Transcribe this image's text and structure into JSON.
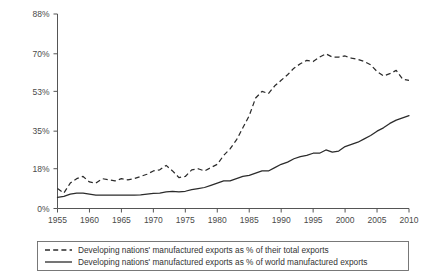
{
  "chart_data": {
    "type": "line",
    "title": "",
    "xlabel": "",
    "ylabel": "",
    "xlim": [
      1955,
      2010
    ],
    "ylim": [
      0,
      88
    ],
    "grid": false,
    "legend_position": "bottom",
    "ytick_labels": [
      "0%",
      "18%",
      "35%",
      "53%",
      "70%",
      "88%"
    ],
    "ytick_values": [
      0,
      18,
      35,
      53,
      70,
      88
    ],
    "xtick_labels": [
      "1955",
      "1960",
      "1965",
      "1970",
      "1975",
      "1980",
      "1985",
      "1990",
      "1995",
      "2000",
      "2005",
      "2010"
    ],
    "xtick_values": [
      1955,
      1960,
      1965,
      1970,
      1975,
      1980,
      1985,
      1990,
      1995,
      2000,
      2005,
      2010
    ],
    "x": [
      1955,
      1956,
      1957,
      1958,
      1959,
      1960,
      1961,
      1962,
      1963,
      1964,
      1965,
      1966,
      1967,
      1968,
      1969,
      1970,
      1971,
      1972,
      1973,
      1974,
      1975,
      1976,
      1977,
      1978,
      1979,
      1980,
      1981,
      1982,
      1983,
      1984,
      1985,
      1986,
      1987,
      1988,
      1989,
      1990,
      1991,
      1992,
      1993,
      1994,
      1995,
      1996,
      1997,
      1998,
      1999,
      2000,
      2001,
      2002,
      2003,
      2004,
      2005,
      2006,
      2007,
      2008,
      2009,
      2010
    ],
    "series": [
      {
        "name": "Developing nations' manufactured exports as % of their total exports",
        "style": "dashed",
        "color": "#2b2b2b",
        "values": [
          9.0,
          7.0,
          11.5,
          13.5,
          14.5,
          12.0,
          11.5,
          13.5,
          13.0,
          12.5,
          13.5,
          13.0,
          13.5,
          14.5,
          15.5,
          17.0,
          17.5,
          19.5,
          17.0,
          14.0,
          14.5,
          17.5,
          18.0,
          17.0,
          18.5,
          20.0,
          24.0,
          27.0,
          31.0,
          36.5,
          42.0,
          50.0,
          53.0,
          52.0,
          55.5,
          58.0,
          60.5,
          63.5,
          65.5,
          67.0,
          66.5,
          68.5,
          70.0,
          68.5,
          68.5,
          69.0,
          68.0,
          67.5,
          66.5,
          65.0,
          62.0,
          60.0,
          61.0,
          62.5,
          58.5,
          58.0
        ]
      },
      {
        "name": "Developing nations' manufactured exports as % of world manufactured exports",
        "style": "solid",
        "color": "#2b2b2b",
        "values": [
          5.0,
          5.5,
          6.5,
          7.0,
          7.0,
          6.5,
          6.0,
          6.0,
          6.0,
          6.0,
          6.0,
          6.0,
          6.0,
          6.2,
          6.5,
          6.8,
          7.0,
          7.5,
          7.8,
          7.5,
          7.8,
          8.5,
          9.0,
          9.5,
          10.5,
          11.5,
          12.5,
          12.5,
          13.5,
          14.5,
          15.0,
          16.0,
          17.0,
          17.0,
          18.5,
          20.0,
          21.0,
          22.5,
          23.5,
          24.0,
          25.0,
          25.0,
          26.5,
          25.5,
          26.0,
          28.0,
          29.0,
          30.0,
          31.5,
          33.0,
          35.0,
          36.5,
          38.5,
          40.0,
          41.0,
          42.0
        ]
      }
    ],
    "legend_entries": [
      {
        "label": "Developing nations' manufactured exports as % of their total exports",
        "style": "dashed"
      },
      {
        "label": "Developing nations' manufactured exports as % of world manufactured exports",
        "style": "solid"
      }
    ]
  }
}
